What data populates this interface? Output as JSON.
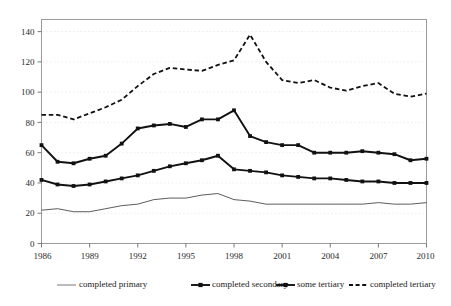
{
  "chart_data": {
    "type": "line",
    "title": "",
    "subtitle": "",
    "xlabel": "",
    "ylabel": "",
    "xlim": [
      1986,
      2010
    ],
    "ylim": [
      0,
      148
    ],
    "grid": true,
    "grid_style": "faint horizontal gridlines at y tick values",
    "legend_position": "bottom",
    "x": [
      1986,
      1987,
      1988,
      1989,
      1990,
      1991,
      1992,
      1993,
      1994,
      1995,
      1996,
      1997,
      1998,
      1999,
      2000,
      2001,
      2002,
      2003,
      2004,
      2005,
      2006,
      2007,
      2008,
      2009,
      2010
    ],
    "yticks": [
      0,
      20,
      40,
      60,
      80,
      100,
      120,
      140
    ],
    "ytick_labels": [
      "0",
      "20",
      "40",
      "60",
      "80",
      "100",
      "120",
      "140"
    ],
    "xticks": [
      1986,
      1989,
      1992,
      1995,
      1998,
      2001,
      2004,
      2007,
      2010
    ],
    "xtick_labels": [
      "1986",
      "1989",
      "1992",
      "1995",
      "1998",
      "2001",
      "2004",
      "2007",
      "2010"
    ],
    "series": [
      {
        "name": "completed primary",
        "style": "thin-solid",
        "marker": "none",
        "color": "#4a4a4a",
        "values": [
          22,
          23,
          21,
          21,
          23,
          25,
          26,
          29,
          30,
          30,
          32,
          33,
          29,
          28,
          26,
          26,
          26,
          26,
          26,
          26,
          26,
          27,
          26,
          26,
          27
        ]
      },
      {
        "name": "completed secondary",
        "style": "thick-solid",
        "marker": "square",
        "color": "#111111",
        "values": [
          42,
          39,
          38,
          39,
          41,
          43,
          45,
          48,
          51,
          53,
          55,
          58,
          49,
          48,
          47,
          45,
          44,
          43,
          43,
          42,
          41,
          41,
          40,
          40,
          40
        ]
      },
      {
        "name": "some tertiary",
        "style": "thick-solid",
        "marker": "square",
        "color": "#111111",
        "values": [
          65,
          54,
          53,
          56,
          58,
          66,
          76,
          78,
          79,
          77,
          82,
          82,
          88,
          71,
          67,
          65,
          65,
          60,
          60,
          60,
          61,
          60,
          59,
          55,
          56
        ]
      },
      {
        "name": "completed tertiary",
        "style": "dashed",
        "marker": "none",
        "color": "#111111",
        "values": [
          85,
          85,
          82,
          86,
          90,
          95,
          104,
          112,
          116,
          115,
          114,
          118,
          121,
          138,
          120,
          108,
          106,
          108,
          103,
          101,
          104,
          106,
          99,
          97,
          99
        ]
      }
    ]
  },
  "legend": {
    "items": [
      {
        "label": "completed primary",
        "style": "thin-solid",
        "marker": "none"
      },
      {
        "label": "completed secondary",
        "style": "thick-solid",
        "marker": "square"
      },
      {
        "label": "some tertiary",
        "style": "thick-solid",
        "marker": "square"
      },
      {
        "label": "completed tertiary",
        "style": "dashed",
        "marker": "none"
      }
    ]
  }
}
